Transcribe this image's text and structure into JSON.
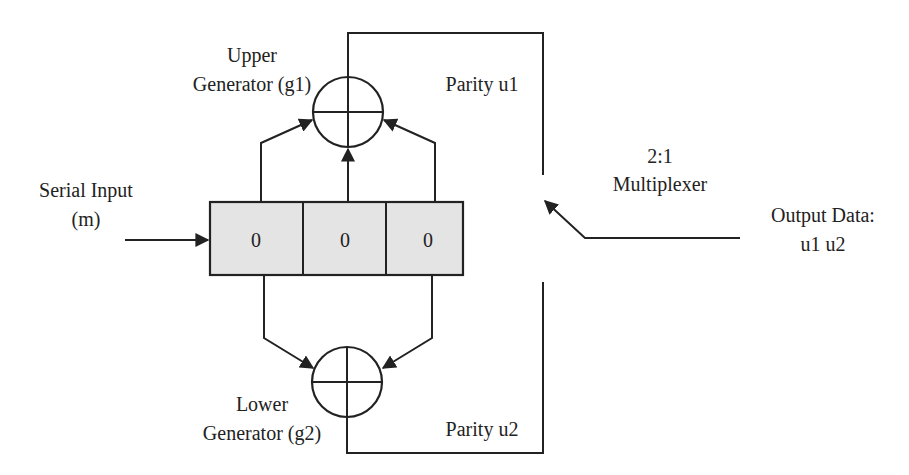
{
  "diagram": {
    "type": "convolutional-encoder",
    "labels": {
      "upper_gen_line1": "Upper",
      "upper_gen_line2": "Generator (g1)",
      "lower_gen_line1": "Lower",
      "lower_gen_line2": "Generator (g2)",
      "parity_u1": "Parity u1",
      "parity_u2": "Parity u2",
      "serial_input_line1": "Serial Input",
      "serial_input_line2": "(m)",
      "mux_line1": "2:1",
      "mux_line2": "Multiplexer",
      "output_line1": "Output Data:",
      "output_line2": "u1 u2"
    },
    "register": {
      "cells": [
        "0",
        "0",
        "0"
      ]
    },
    "nodes": [
      {
        "id": "serial-input",
        "label": "Serial Input (m)"
      },
      {
        "id": "shift-register",
        "label": "3-stage shift register",
        "values": [
          "0",
          "0",
          "0"
        ]
      },
      {
        "id": "upper-xor",
        "label": "Upper Generator (g1)"
      },
      {
        "id": "lower-xor",
        "label": "Lower Generator (g2)"
      },
      {
        "id": "mux",
        "label": "2:1 Multiplexer"
      },
      {
        "id": "output",
        "label": "Output Data: u1 u2"
      }
    ],
    "edges": [
      {
        "from": "serial-input",
        "to": "shift-register"
      },
      {
        "from": "shift-register.cell0",
        "to": "upper-xor"
      },
      {
        "from": "shift-register.cell1",
        "to": "upper-xor"
      },
      {
        "from": "shift-register.cell2",
        "to": "upper-xor"
      },
      {
        "from": "shift-register.cell0",
        "to": "lower-xor"
      },
      {
        "from": "shift-register.cell2",
        "to": "lower-xor"
      },
      {
        "from": "upper-xor",
        "to": "mux",
        "label": "Parity u1"
      },
      {
        "from": "lower-xor",
        "to": "mux",
        "label": "Parity u2"
      },
      {
        "from": "mux",
        "to": "output"
      }
    ],
    "colors": {
      "line": "#222222",
      "register_fill": "#e4e4e4",
      "background": "#ffffff"
    }
  }
}
